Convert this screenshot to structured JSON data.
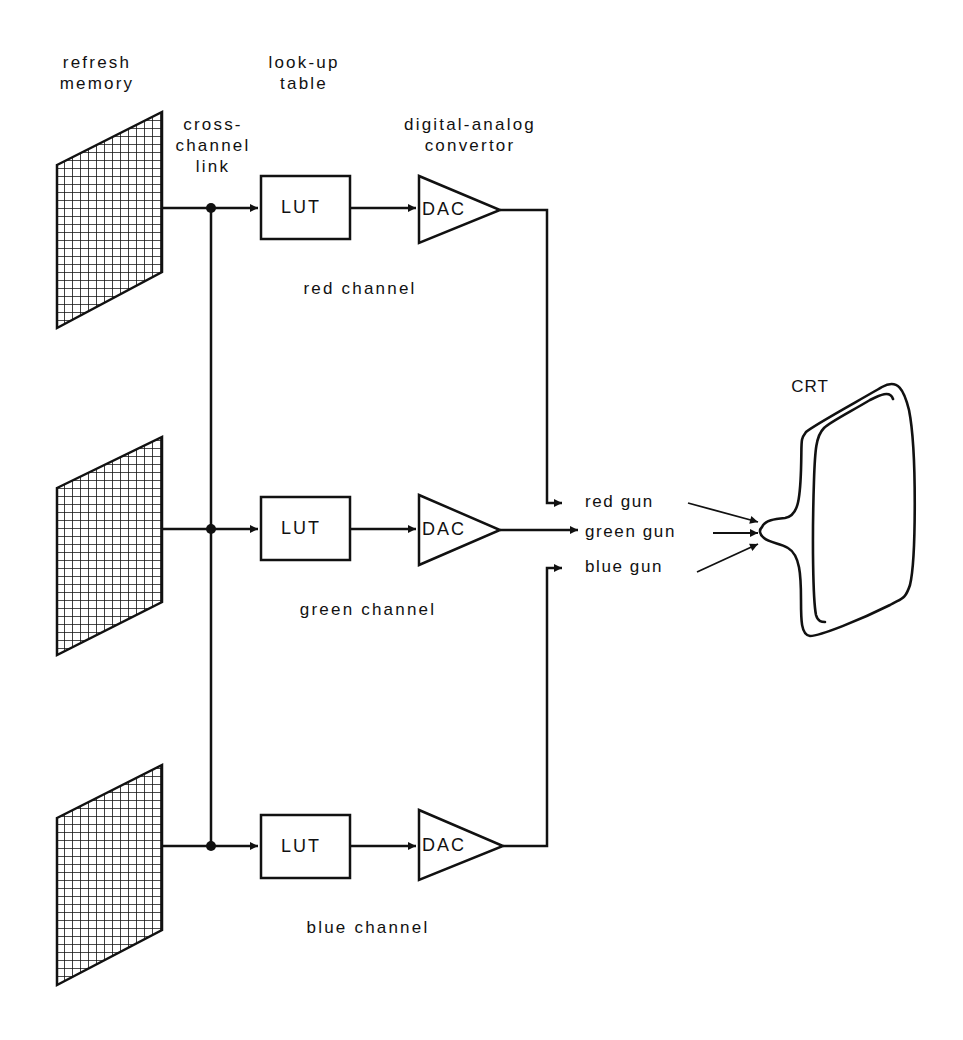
{
  "labels": {
    "refresh_memory": "refresh\nmemory",
    "refresh_memory_l1": "refresh",
    "refresh_memory_l2": "memory",
    "lookup_table_l1": "look-up",
    "lookup_table_l2": "table",
    "cross_channel_l1": "cross-",
    "cross_channel_l2": "channel",
    "cross_channel_l3": "link",
    "dac_l1": "digital-analog",
    "dac_l2": "convertor",
    "crt": "CRT"
  },
  "channels": [
    {
      "name": "red channel",
      "lut": "LUT",
      "dac": "DAC",
      "gun": "red gun"
    },
    {
      "name": "green channel",
      "lut": "LUT",
      "dac": "DAC",
      "gun": "green gun"
    },
    {
      "name": "blue channel",
      "lut": "LUT",
      "dac": "DAC",
      "gun": "blue gun"
    }
  ],
  "colors": {
    "ink": "#111111",
    "background": "#ffffff"
  }
}
